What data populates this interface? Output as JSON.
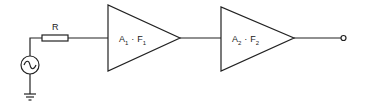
{
  "diagram": {
    "type": "circuit-block-diagram",
    "resistor": {
      "label": "R"
    },
    "source": {
      "type": "ac-voltage-source"
    },
    "ground": {
      "type": "ground"
    },
    "stages": [
      {
        "name": "A",
        "sub_a": "1",
        "sep": "·",
        "name_f": "F",
        "sub_f": "1"
      },
      {
        "name": "A",
        "sub_a": "2",
        "sep": "·",
        "name_f": "F",
        "sub_f": "2"
      }
    ],
    "output": {
      "type": "terminal"
    }
  }
}
